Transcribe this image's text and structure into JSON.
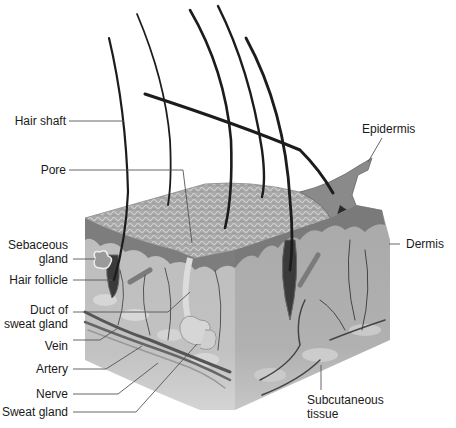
{
  "diagram": {
    "type": "anatomical cross-section",
    "colors": {
      "background": "#ffffff",
      "label_text": "#1a1a1a",
      "leader_line": "#555555",
      "epidermis_surface": "#a8a8a8",
      "epidermis_layer": "#7a7a7a",
      "dermis": "#b4b4b4",
      "subcutaneous": "#c8c8c8",
      "hair": "#1c1c1c",
      "vessel": "#4a4a4a"
    },
    "labels": {
      "left": [
        {
          "id": "hair-shaft",
          "text": "Hair shaft"
        },
        {
          "id": "pore",
          "text": "Pore"
        },
        {
          "id": "sebaceous-gland",
          "line1": "Sebaceous",
          "line2": "gland"
        },
        {
          "id": "hair-follicle",
          "text": "Hair follicle"
        },
        {
          "id": "duct-of-sweat-gland",
          "line1": "Duct of",
          "line2": "sweat gland"
        },
        {
          "id": "vein",
          "text": "Vein"
        },
        {
          "id": "artery",
          "text": "Artery"
        },
        {
          "id": "nerve",
          "text": "Nerve"
        },
        {
          "id": "sweat-gland",
          "text": "Sweat gland"
        }
      ],
      "right": [
        {
          "id": "epidermis",
          "text": "Epidermis"
        },
        {
          "id": "dermis",
          "text": "Dermis"
        },
        {
          "id": "subcutaneous-tissue",
          "line1": "Subcutaneous",
          "line2": "tissue"
        }
      ]
    }
  }
}
